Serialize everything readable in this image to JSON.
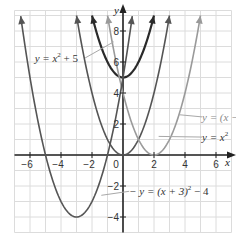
{
  "chart_data": {
    "type": "line",
    "title": "",
    "xlabel": "x",
    "ylabel": "y",
    "xlim": [
      -7,
      7
    ],
    "ylim": [
      -5,
      9
    ],
    "grid": true,
    "x_ticks": [
      -6,
      -4,
      -2,
      0,
      2,
      4,
      6
    ],
    "y_ticks": [
      -4,
      -2,
      2,
      4,
      6,
      8
    ],
    "x_tick_labels": [
      "−6",
      "−4",
      "−2",
      "0",
      "2",
      "4",
      "6"
    ],
    "y_tick_labels": [
      "−4",
      "−2",
      "2",
      "4",
      "6",
      "8"
    ],
    "series": [
      {
        "name": "y = x² + 5",
        "equation": "x^2 + 5",
        "vertex": [
          0,
          5
        ],
        "color": "#2a2a2a",
        "width": 2.2,
        "x_range": [
          -2,
          2
        ],
        "sample_points": [
          [
            -2,
            9
          ],
          [
            -1,
            6
          ],
          [
            0,
            5
          ],
          [
            1,
            6
          ],
          [
            2,
            9
          ]
        ],
        "a": 1,
        "h": 0,
        "k": 5
      },
      {
        "name": "y = x²",
        "equation": "x^2",
        "vertex": [
          0,
          0
        ],
        "color": "#555555",
        "width": 1.6,
        "x_range": [
          -3,
          3
        ],
        "sample_points": [
          [
            -3,
            9
          ],
          [
            -2,
            4
          ],
          [
            -1,
            1
          ],
          [
            0,
            0
          ],
          [
            1,
            1
          ],
          [
            2,
            4
          ],
          [
            3,
            9
          ]
        ],
        "a": 1,
        "h": 0,
        "k": 0
      },
      {
        "name": "y = (x − 2)²",
        "equation": "(x-2)^2",
        "vertex": [
          2,
          0
        ],
        "color": "#9a9a9a",
        "width": 1.6,
        "x_range": [
          -1,
          5
        ],
        "sample_points": [
          [
            -1,
            9
          ],
          [
            0,
            4
          ],
          [
            1,
            1
          ],
          [
            2,
            0
          ],
          [
            3,
            1
          ],
          [
            4,
            4
          ],
          [
            5,
            9
          ]
        ],
        "a": 1,
        "h": 2,
        "k": 0
      },
      {
        "name": "y = (x + 3)² − 4",
        "equation": "(x+3)^2 - 4",
        "vertex": [
          -3,
          -4
        ],
        "color": "#555555",
        "width": 1.6,
        "x_range": [
          -6.6,
          0.6
        ],
        "sample_points": [
          [
            -6,
            5
          ],
          [
            -5,
            0
          ],
          [
            -4,
            -3
          ],
          [
            -3,
            -4
          ],
          [
            -2,
            -3
          ],
          [
            -1,
            0
          ],
          [
            0,
            5
          ]
        ],
        "a": 1,
        "h": -3,
        "k": -4
      }
    ],
    "annotations": [
      {
        "text_prefix": "y = x",
        "sup": "2",
        "text_suffix": " + 5",
        "series": 0,
        "label_pos": [
          -5.7,
          6
        ],
        "pointer_to": [
          -0.6,
          7.3
        ]
      },
      {
        "text_prefix": "y = (x − 2)",
        "sup": "2",
        "text_suffix": "",
        "series": 2,
        "label_pos": [
          5.1,
          2.2
        ],
        "pointer_to": [
          3.6,
          2.6
        ]
      },
      {
        "text_prefix": "y = x",
        "sup": "2",
        "text_suffix": "",
        "series": 1,
        "label_pos": [
          5.1,
          0.9
        ],
        "pointer_to": [
          2.3,
          1.2
        ]
      },
      {
        "text_prefix": "− y = (x + 3)",
        "sup": "2",
        "text_suffix": " − 4",
        "series": 3,
        "label_pos": [
          0.4,
          -2.6
        ],
        "pointer_to": [
          -1.4,
          -2.6
        ]
      }
    ]
  }
}
